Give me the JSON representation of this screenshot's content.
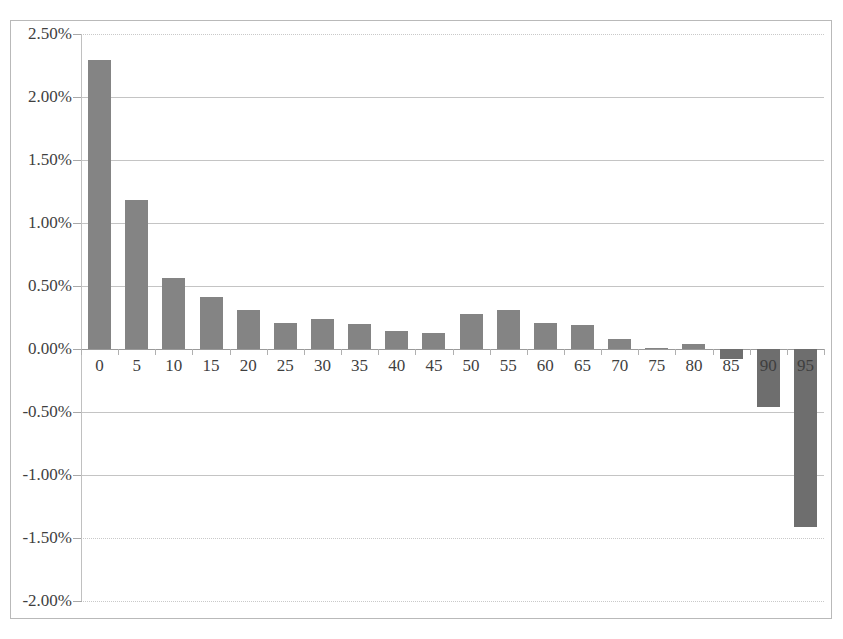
{
  "chart_data": {
    "type": "bar",
    "title": "",
    "xlabel": "",
    "ylabel": "",
    "ylim": [
      -0.02,
      0.025
    ],
    "ytick_labels": [
      "2.50%",
      "2.00%",
      "1.50%",
      "1.00%",
      "0.50%",
      "0.00%",
      "-0.50%",
      "-1.00%",
      "-1.50%",
      "-2.00%"
    ],
    "ytick_values": [
      2.5,
      2.0,
      1.5,
      1.0,
      0.5,
      0.0,
      -0.5,
      -1.0,
      -1.5,
      -2.0
    ],
    "categories": [
      "0",
      "5",
      "10",
      "15",
      "20",
      "25",
      "30",
      "35",
      "40",
      "45",
      "50",
      "55",
      "60",
      "65",
      "70",
      "75",
      "80",
      "85",
      "90",
      "95"
    ],
    "values": [
      2.29,
      1.18,
      0.56,
      0.41,
      0.31,
      0.21,
      0.24,
      0.2,
      0.14,
      0.13,
      0.28,
      0.31,
      0.21,
      0.19,
      0.08,
      0.01,
      0.04,
      -0.08,
      -0.46,
      -1.41
    ],
    "value_unit": "percent",
    "grid": true,
    "legend": false,
    "bar_color": "#848484",
    "negative_bar_color": "#6e6e6e",
    "gridline_color": "#c4c4c4",
    "axis_color": "#c0c0c0",
    "frame_color": "#b9b9b9",
    "background_color": "#ffffff"
  }
}
